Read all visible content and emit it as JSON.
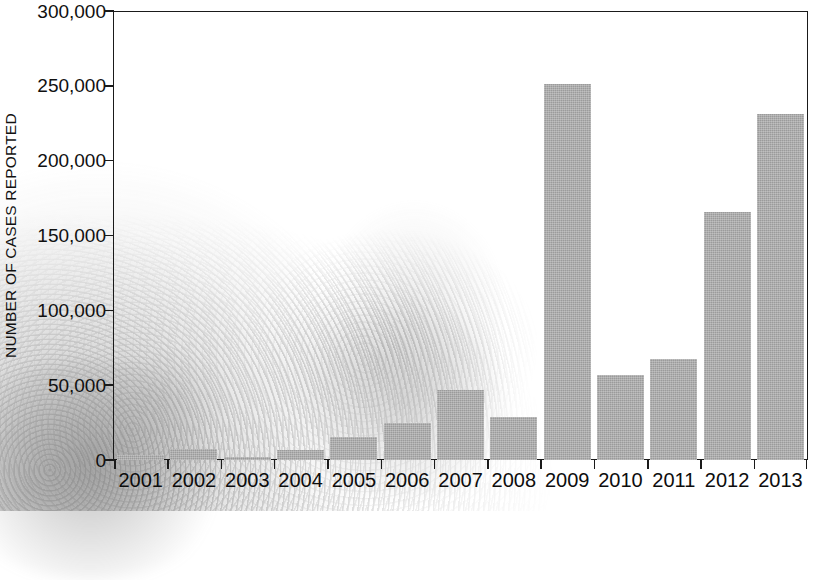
{
  "chart_data": {
    "type": "bar",
    "title": "",
    "subtitle": "",
    "xlabel": "",
    "ylabel": "NUMBER OF CASES REPORTED",
    "categories": [
      "2001",
      "2002",
      "2003",
      "2004",
      "2005",
      "2006",
      "2007",
      "2008",
      "2009",
      "2010",
      "2011",
      "2012",
      "2013"
    ],
    "values": [
      3500,
      7500,
      2000,
      6500,
      15500,
      24500,
      47000,
      29000,
      251000,
      57000,
      67500,
      165500,
      231500
    ],
    "series": [
      {
        "name": "Number of cases reported",
        "values": [
          3500,
          7500,
          2000,
          6500,
          15500,
          24500,
          47000,
          29000,
          251000,
          57000,
          67500,
          165500,
          231500
        ]
      }
    ],
    "ylim": [
      0,
      300000
    ],
    "ytick_values": [
      0,
      50000,
      100000,
      150000,
      200000,
      250000,
      300000
    ],
    "ytick_labels": [
      "0",
      "50,000",
      "100,000",
      "150,000",
      "200,000",
      "250,000",
      "300,000"
    ],
    "grid": false,
    "legend": false,
    "legend_position": "none",
    "bar_color": "#9b9b9b",
    "axis_color": "#1a1a1a",
    "background_color": "#ffffff",
    "annotations": []
  },
  "axes": {
    "y_title": "NUMBER OF CASES REPORTED"
  },
  "background": {
    "watermark_description": "faded grayscale photographic texture in lower-left and lower-center"
  }
}
